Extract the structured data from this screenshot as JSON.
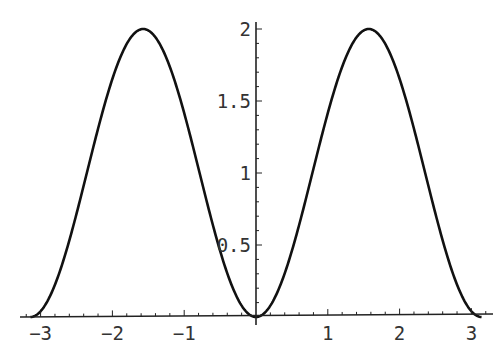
{
  "chart_data": {
    "type": "line",
    "title": "",
    "xlabel": "",
    "ylabel": "",
    "function_hint": "2*sin(x)^2",
    "xlim": [
      -3.14159,
      3.14159
    ],
    "ylim": [
      0,
      2
    ],
    "grid": false,
    "legend": null,
    "x_ticks": [
      -3,
      -2,
      -1,
      1,
      2,
      3
    ],
    "x_tick_labels": [
      "-3",
      "-2",
      "-1",
      "1",
      "2",
      "3"
    ],
    "y_ticks": [
      0.5,
      1,
      1.5,
      2
    ],
    "y_tick_labels": [
      "0.5",
      "1",
      "1.5",
      "2"
    ],
    "series": [
      {
        "name": "f(x)",
        "color": "#111111",
        "x": [
          -3.1416,
          -2.75,
          -2.36,
          -1.96,
          -1.5708,
          -1.18,
          -0.785,
          -0.39,
          0,
          0.39,
          0.785,
          1.18,
          1.5708,
          1.96,
          2.36,
          2.75,
          3.1416
        ],
        "y": [
          0,
          0.29,
          1.0,
          1.71,
          2.0,
          1.71,
          1.0,
          0.29,
          0,
          0.29,
          1.0,
          1.71,
          2.0,
          1.71,
          1.0,
          0.29,
          0
        ]
      }
    ]
  },
  "style": {
    "axis_color": "#222222",
    "curve_color": "#111111",
    "label_color": "#333333"
  }
}
